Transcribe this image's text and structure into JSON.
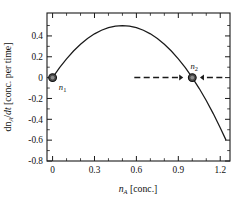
{
  "chart_data": {
    "type": "line",
    "title": "",
    "subtitle": "",
    "xlabel": "n_A [conc.]",
    "xlabel_parts": {
      "symbol": "n",
      "subscript": "A",
      "unit": "[conc.]"
    },
    "ylabel": "dn_A/dt [conc. per time]",
    "ylabel_parts": {
      "numerator": "dn",
      "numerator_sub": "A",
      "denominator": "dt",
      "unit": "[conc. per time]"
    },
    "xlim": [
      -0.04,
      1.27
    ],
    "ylim": [
      -0.8,
      0.62
    ],
    "xticks": [
      0,
      0.3,
      0.6,
      0.9,
      1.2
    ],
    "xticklabels": [
      "0",
      "0.3",
      "0.6",
      "0.9",
      "1.2"
    ],
    "yticks": [
      0.4,
      0.2,
      0,
      -0.2,
      -0.4,
      -0.6,
      -0.8
    ],
    "yticklabels": [
      "0.4",
      "0.2",
      "0",
      "-0.2",
      "-0.4",
      "-0.6",
      "-0.8"
    ],
    "x_minor_per_major": 2,
    "y_minor_per_major": 1,
    "grid": false,
    "legend": "none",
    "equation": "dn_A/dt = 2 n_A (1 - n_A)",
    "series": [
      {
        "name": "dn_A/dt",
        "color": "#1a1a1a",
        "x": [
          0.0,
          0.05,
          0.1,
          0.15,
          0.2,
          0.25,
          0.3,
          0.35,
          0.4,
          0.45,
          0.5,
          0.55,
          0.6,
          0.65,
          0.7,
          0.75,
          0.8,
          0.85,
          0.9,
          0.95,
          1.0,
          1.05,
          1.1,
          1.15,
          1.2,
          1.24
        ],
        "y": [
          0.0,
          0.095,
          0.18,
          0.255,
          0.32,
          0.375,
          0.42,
          0.455,
          0.48,
          0.495,
          0.5,
          0.495,
          0.48,
          0.455,
          0.42,
          0.375,
          0.32,
          0.255,
          0.18,
          0.095,
          0.0,
          -0.105,
          -0.22,
          -0.345,
          -0.48,
          -0.595
        ]
      }
    ],
    "markers": [
      {
        "name": "n1",
        "label": "n",
        "subscript": "1",
        "x": 0.0,
        "y": 0.0,
        "label_dx": 10,
        "label_dy": 12,
        "style": "filled-circle"
      },
      {
        "name": "n2",
        "label": "n",
        "subscript": "2",
        "x": 1.0,
        "y": 0.0,
        "label_dx": 2,
        "label_dy": -9,
        "style": "filled-circle"
      }
    ],
    "annotations": [
      {
        "name": "flow-arrow-left",
        "type": "dashed-arrow",
        "from_x": 0.585,
        "to_x": 0.935,
        "y": 0.0,
        "direction": "right",
        "description": "dashed arrow pointing right toward n2"
      },
      {
        "name": "flow-arrow-right",
        "type": "dashed-arrow",
        "from_x": 1.215,
        "to_x": 1.055,
        "y": 0.0,
        "direction": "left",
        "description": "dashed arrow pointing left toward n2"
      }
    ]
  },
  "figure": {
    "background": "#ffffff",
    "foreground": "#1a1a1a",
    "marker_fill": "#4a4a4a",
    "curve_color": "#1a1a1a"
  }
}
